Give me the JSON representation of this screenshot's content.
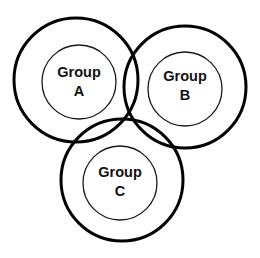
{
  "diagram": {
    "type": "venn",
    "background": "#ffffff",
    "stroke_color": "#000000",
    "groups": [
      {
        "id": "A",
        "line1": "Group",
        "line2": "A",
        "outer": {
          "cx": 76,
          "cy": 80,
          "r": 62
        },
        "inner": {
          "cx": 79,
          "cy": 82,
          "r": 37
        }
      },
      {
        "id": "B",
        "line1": "Group",
        "line2": "B",
        "outer": {
          "cx": 185,
          "cy": 87,
          "r": 61
        },
        "inner": {
          "cx": 185,
          "cy": 89,
          "r": 37
        }
      },
      {
        "id": "C",
        "line1": "Group",
        "line2": "C",
        "outer": {
          "cx": 122,
          "cy": 180,
          "r": 61
        },
        "inner": {
          "cx": 120,
          "cy": 183,
          "r": 37
        }
      }
    ]
  }
}
